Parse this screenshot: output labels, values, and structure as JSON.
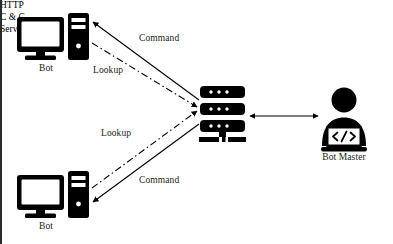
{
  "figure": {
    "background_color": "#ffffff",
    "ink_color": "#000000",
    "width": 393,
    "height": 244
  },
  "nodes": {
    "bot_top": {
      "label": "Bot",
      "icon": "desktop-computer-icon",
      "position": {
        "x": 46,
        "y": 40
      }
    },
    "bot_bottom": {
      "label": "Bot",
      "icon": "desktop-computer-icon",
      "position": {
        "x": 46,
        "y": 198
      }
    },
    "server": {
      "label_line1": "HTTP",
      "label_line2": "C & C",
      "label_line3": "Server",
      "label": "HTTP C & C Server",
      "icon": "server-rack-icon",
      "position": {
        "x": 222,
        "y": 113
      }
    },
    "bot_master": {
      "label": "Bot Master",
      "icon": "person-with-laptop-icon",
      "laptop_glyph": "</>",
      "position": {
        "x": 344,
        "y": 118
      }
    }
  },
  "edges": [
    {
      "id": "command-top",
      "label": "Command",
      "style": "solid",
      "arrow": "single",
      "from": "server",
      "to": "bot_top"
    },
    {
      "id": "lookup-top",
      "label": "Lookup",
      "style": "dash-dot",
      "arrow": "single",
      "from": "bot_top",
      "to": "server"
    },
    {
      "id": "lookup-bottom",
      "label": "Lookup",
      "style": "dash-dot",
      "arrow": "single",
      "from": "bot_bottom",
      "to": "server"
    },
    {
      "id": "command-bottom",
      "label": "Command",
      "style": "solid",
      "arrow": "single",
      "from": "server",
      "to": "bot_bottom"
    },
    {
      "id": "server-botmaster",
      "label": "",
      "style": "solid",
      "arrow": "double",
      "from": "server",
      "to": "bot_master"
    }
  ]
}
